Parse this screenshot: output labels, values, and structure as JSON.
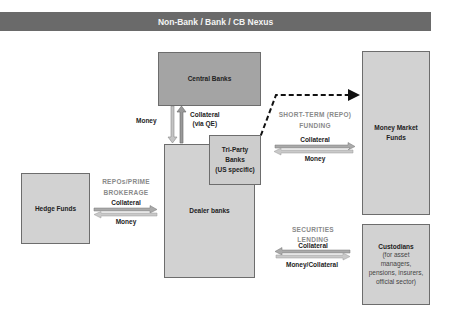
{
  "title": "Non-Bank / Bank / CB Nexus",
  "colors": {
    "title_bar": "#6a6a6a",
    "box_fill": "#d2d2d2",
    "central_bank_fill": "#a4a4a4",
    "arrow_fill": "#b8b8b8",
    "category_text": "#8a8a8a"
  },
  "nodes": {
    "central_banks": {
      "label": "Central Banks"
    },
    "dealer_banks": {
      "label": "Dealer banks"
    },
    "tri_party": {
      "line1": "Tri-Party",
      "line2": "Banks",
      "line3": "(US specific)"
    },
    "hedge_funds": {
      "label": "Hedge Funds"
    },
    "money_market": {
      "line1": "Money Market",
      "line2": "Funds"
    },
    "custodians": {
      "label": "Custodians",
      "line1": "(for asset",
      "line2": "managers,",
      "line3": "pensions, insurers,",
      "line4": "official sector)"
    }
  },
  "flows": {
    "cb": {
      "money": "Money",
      "collateral_line1": "Collateral",
      "collateral_line2": "(via QE)"
    },
    "repo_prime": {
      "cat_line1": "REPOs/PRIME",
      "cat_line2": "BROKERAGE",
      "top": "Collateral",
      "bottom": "Money"
    },
    "short_term": {
      "cat_line1": "SHORT-TERM (REPO)",
      "cat_line2": "FUNDING",
      "top": "Collateral",
      "bottom": "Money"
    },
    "sec_lending": {
      "cat_line1": "SECURITIES",
      "cat_line2": "LENDING",
      "top": "Collateral",
      "bottom": "Money/Collateral"
    }
  }
}
